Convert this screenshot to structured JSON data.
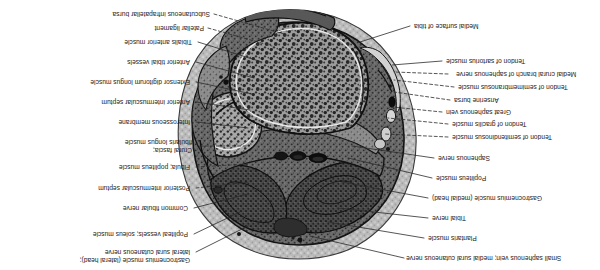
{
  "figure": {
    "orientation": "rotated-180",
    "modality": "grayscale anatomical cross-section photograph",
    "region": "transverse section of right leg through proximal tibia / knee",
    "background_color": "#ffffff",
    "ink_color": "#1a1a1a"
  },
  "labels_left": [
    {
      "id": "small-saphenous-vein",
      "text": "Small saphenous vein; medial sural cutaneous nerve"
    },
    {
      "id": "plantaris-muscle",
      "text": "Plantaris muscle"
    },
    {
      "id": "tibial-nerve",
      "text": "Tibial nerve"
    },
    {
      "id": "gastrocnemius-medial-head",
      "text": "Gastrocnemius muscle (medial head)"
    },
    {
      "id": "popliteus-muscle",
      "text": "Popliteus muscle"
    },
    {
      "id": "saphenous-nerve",
      "text": "Saphenous nerve"
    },
    {
      "id": "tendon-semitendinosus",
      "text": "Tendon of semitendinosus muscle"
    },
    {
      "id": "tendon-gracilis",
      "text": "Tendon of gracilis muscle"
    },
    {
      "id": "great-saphenous-vein",
      "text": "Great saphenous vein"
    },
    {
      "id": "anserine-bursa",
      "text": "Anserine bursa"
    },
    {
      "id": "tendon-semimembranosus",
      "text": "Tendon of semimembranosus muscle"
    },
    {
      "id": "medial-crural-branch",
      "text": "Medial crural branch of saphenous nerve"
    },
    {
      "id": "tendon-sartorius",
      "text": "Tendon of sartorius muscle"
    },
    {
      "id": "medial-surface-tibia",
      "text": "Medial surface of tibia"
    }
  ],
  "labels_right": [
    {
      "id": "gastrocnemius-lateral-head",
      "text": "Gastrocnemius muscle (lateral head);\nlateral sural cutaneous nerve"
    },
    {
      "id": "popliteal-vessels-soleus",
      "text": "Popliteal vessels; soleus muscle"
    },
    {
      "id": "common-fibular-nerve",
      "text": "Common fibular nerve"
    },
    {
      "id": "posterior-intermuscular-septum",
      "text": "Posterior intermuscular septum"
    },
    {
      "id": "fibula-popliteus",
      "text": "Fibula; popliteus muscle"
    },
    {
      "id": "crural-fascia-fibularis",
      "text": "Crural fascia;\nfibularis longus muscle"
    },
    {
      "id": "interosseous-membrane",
      "text": "Interosseous membrane"
    },
    {
      "id": "anterior-intermuscular-septum",
      "text": "Anterior intermuscular septum"
    },
    {
      "id": "extensor-digitorum-longus",
      "text": "Extensor digitorum longus muscle"
    },
    {
      "id": "anterior-tibial-vessels",
      "text": "Anterior tibial vessels"
    },
    {
      "id": "tibialis-anterior-muscle",
      "text": "Tibialis anterior muscle"
    },
    {
      "id": "patellar-ligament",
      "text": "Patellar ligament"
    },
    {
      "id": "subcutaneous-infrapatellar-bursa",
      "text": "Subcutaneous infrapatellar bursa"
    }
  ],
  "colors": {
    "ink": "#1a1a1a",
    "leader": "#2b2b2b",
    "fascia_light": "#bdbdbd",
    "muscle_mid": "#6e6e6e",
    "muscle_dark": "#3b3b3b",
    "bone_marrow": "#8a8a8a",
    "bone_cortex": "#4a4a4a",
    "vessel_black": "#151515",
    "paper": "#ffffff"
  }
}
